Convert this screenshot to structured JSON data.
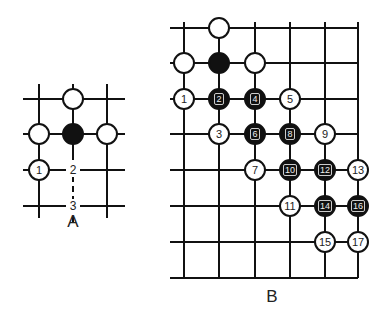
{
  "diagrams": [
    {
      "id": "A",
      "caption": "A",
      "caption_pos": [
        73,
        212
      ],
      "grid": {
        "vlines": [
          {
            "x": 39,
            "y1": 84,
            "y2": 218
          },
          {
            "x": 73,
            "y1": 84,
            "y2": 160
          },
          {
            "x": 107,
            "y1": 84,
            "y2": 218
          }
        ],
        "hlines": [
          {
            "y": 99,
            "x1": 23,
            "x2": 125
          },
          {
            "y": 134,
            "x1": 23,
            "x2": 125
          },
          {
            "y": 170,
            "x1": 23,
            "x2": 125
          },
          {
            "y": 206,
            "x1": 23,
            "x2": 125
          }
        ],
        "dashed_vlines": [
          {
            "x": 73,
            "y1": 176,
            "y2": 222
          }
        ]
      },
      "stones": [
        {
          "color": "white",
          "x": 73,
          "y": 99,
          "label": ""
        },
        {
          "color": "white",
          "x": 39,
          "y": 134,
          "label": ""
        },
        {
          "color": "black",
          "x": 73,
          "y": 134,
          "label": ""
        },
        {
          "color": "white",
          "x": 107,
          "y": 134,
          "label": ""
        },
        {
          "color": "white",
          "x": 39,
          "y": 170,
          "label": "1"
        }
      ],
      "point_labels": [
        {
          "x": 73,
          "y": 170,
          "label": "2"
        },
        {
          "x": 73,
          "y": 206,
          "label": "3"
        }
      ]
    },
    {
      "id": "B",
      "caption": "B",
      "caption_pos": [
        272,
        287
      ],
      "grid": {
        "vlines": [
          {
            "x": 184,
            "y1": 22,
            "y2": 278
          },
          {
            "x": 219,
            "y1": 22,
            "y2": 278
          },
          {
            "x": 255,
            "y1": 22,
            "y2": 278
          },
          {
            "x": 290,
            "y1": 22,
            "y2": 278
          },
          {
            "x": 325,
            "y1": 22,
            "y2": 278
          },
          {
            "x": 358,
            "y1": 22,
            "y2": 278
          }
        ],
        "hlines": [
          {
            "y": 28,
            "x1": 170,
            "x2": 358
          },
          {
            "y": 63,
            "x1": 170,
            "x2": 358
          },
          {
            "y": 99,
            "x1": 170,
            "x2": 358
          },
          {
            "y": 134,
            "x1": 170,
            "x2": 358
          },
          {
            "y": 170,
            "x1": 170,
            "x2": 358
          },
          {
            "y": 206,
            "x1": 170,
            "x2": 358
          },
          {
            "y": 242,
            "x1": 170,
            "x2": 358
          },
          {
            "y": 278,
            "x1": 170,
            "x2": 358
          }
        ],
        "dashed_vlines": []
      },
      "stones": [
        {
          "color": "white",
          "x": 219,
          "y": 28,
          "label": ""
        },
        {
          "color": "white",
          "x": 184,
          "y": 63,
          "label": ""
        },
        {
          "color": "black",
          "x": 219,
          "y": 63,
          "label": ""
        },
        {
          "color": "white",
          "x": 255,
          "y": 63,
          "label": ""
        },
        {
          "color": "white",
          "x": 184,
          "y": 99,
          "label": "1"
        },
        {
          "color": "black",
          "x": 219,
          "y": 99,
          "label": "2"
        },
        {
          "color": "black",
          "x": 255,
          "y": 99,
          "label": "4"
        },
        {
          "color": "white",
          "x": 290,
          "y": 99,
          "label": "5"
        },
        {
          "color": "white",
          "x": 219,
          "y": 134,
          "label": "3"
        },
        {
          "color": "black",
          "x": 255,
          "y": 134,
          "label": "6"
        },
        {
          "color": "black",
          "x": 290,
          "y": 134,
          "label": "8"
        },
        {
          "color": "white",
          "x": 325,
          "y": 134,
          "label": "9"
        },
        {
          "color": "white",
          "x": 255,
          "y": 170,
          "label": "7"
        },
        {
          "color": "black",
          "x": 290,
          "y": 170,
          "label": "10"
        },
        {
          "color": "black",
          "x": 325,
          "y": 170,
          "label": "12"
        },
        {
          "color": "white",
          "x": 358,
          "y": 170,
          "label": "13"
        },
        {
          "color": "white",
          "x": 290,
          "y": 206,
          "label": "11"
        },
        {
          "color": "black",
          "x": 325,
          "y": 206,
          "label": "14"
        },
        {
          "color": "black",
          "x": 358,
          "y": 206,
          "label": "16"
        },
        {
          "color": "white",
          "x": 325,
          "y": 242,
          "label": "15"
        },
        {
          "color": "white",
          "x": 358,
          "y": 242,
          "label": "17"
        }
      ],
      "point_labels": []
    }
  ]
}
